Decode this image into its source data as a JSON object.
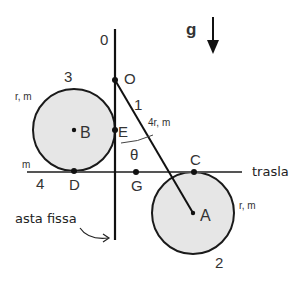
{
  "diagram": {
    "gravity": {
      "label": "g"
    },
    "fixed_rod": {
      "number": "0",
      "caption": "asta fissa"
    },
    "rod": {
      "number": "1",
      "props": "4r, m"
    },
    "disk_A": {
      "number": "2",
      "center_label": "A",
      "props": "r, m"
    },
    "disk_B": {
      "number": "3",
      "center_label": "B",
      "props": "r, m"
    },
    "slider": {
      "number": "4",
      "props": "m",
      "caption": "trasla"
    },
    "points": {
      "O": "O",
      "E": "E",
      "D": "D",
      "G": "G",
      "C": "C"
    },
    "angle": {
      "symbol": "θ"
    },
    "colors": {
      "line": "#1a1a1a",
      "disk_fill": "#e6e6e6",
      "text": "#333333"
    }
  }
}
